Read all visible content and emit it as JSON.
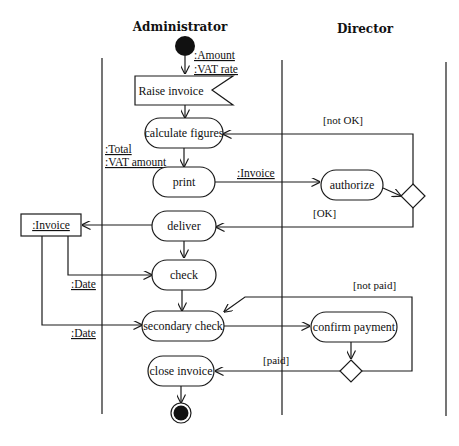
{
  "diagram": {
    "type": "UML activity diagram",
    "swimlanes": [
      {
        "id": "administrator",
        "title": "Administrator"
      },
      {
        "id": "director",
        "title": "Director"
      }
    ],
    "activities": {
      "raise_invoice": "Raise invoice",
      "calculate_figures": "calculate figures",
      "print": "print",
      "authorize": "authorize",
      "deliver": "deliver",
      "check": "check",
      "secondary_check": "secondary check",
      "confirm_payment": "confirm payment",
      "close_invoice": "close invoice"
    },
    "objects": {
      "amount": ":Amount",
      "vat_rate": ":VAT rate",
      "total": ":Total",
      "vat_amount": ":VAT amount",
      "invoice_flow": ":Invoice",
      "invoice_node": ":Invoice",
      "date_check": ":Date",
      "date_secondary": ":Date"
    },
    "guards": {
      "not_ok": "[not OK]",
      "ok": "[OK]",
      "not_paid": "[not paid]",
      "paid": "[paid]"
    },
    "flows": [
      {
        "from": "start",
        "to": "Raise invoice"
      },
      {
        "from": "Raise invoice",
        "to": "calculate figures"
      },
      {
        "from": "calculate figures",
        "to": "print"
      },
      {
        "from": "print",
        "to": "authorize",
        "object": ":Invoice"
      },
      {
        "from": "authorize",
        "to": "decision-authorize"
      },
      {
        "from": "decision-authorize",
        "to": "calculate figures",
        "guard": "[not OK]"
      },
      {
        "from": "decision-authorize",
        "to": "deliver",
        "guard": "[OK]"
      },
      {
        "from": "deliver",
        "to": ":Invoice"
      },
      {
        "from": "deliver",
        "to": "check"
      },
      {
        "from": ":Invoice",
        "to": "check",
        "object": ":Date"
      },
      {
        "from": ":Invoice",
        "to": "secondary check",
        "object": ":Date"
      },
      {
        "from": "check",
        "to": "secondary check"
      },
      {
        "from": "secondary check",
        "to": "confirm payment"
      },
      {
        "from": "confirm payment",
        "to": "decision-payment"
      },
      {
        "from": "decision-payment",
        "to": "secondary check",
        "guard": "[not paid]"
      },
      {
        "from": "decision-payment",
        "to": "close invoice",
        "guard": "[paid]"
      },
      {
        "from": "close invoice",
        "to": "end"
      }
    ]
  }
}
